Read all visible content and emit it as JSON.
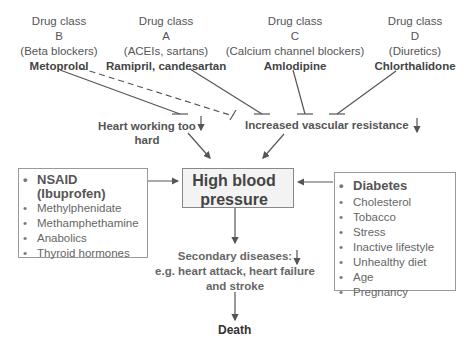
{
  "drug_classes": [
    {
      "title": "Drug class",
      "letter": "B",
      "group": "(Beta blockers)",
      "drug": "Metoprolol"
    },
    {
      "title": "Drug class",
      "letter": "A",
      "group": "(ACEIs, sartans)",
      "drug": "Ramipril, candesartan"
    },
    {
      "title": "Drug class",
      "letter": "C",
      "group": "(Calcium channel blockers)",
      "drug": "Amlodipine"
    },
    {
      "title": "Drug class",
      "letter": "D",
      "group": "(Diuretics)",
      "drug": "Chlorthalidone"
    }
  ],
  "mechanisms": {
    "heart_line1": "Heart working too",
    "heart_line2": "hard",
    "vascular": "Increased vascular resistance"
  },
  "central": {
    "line1": "High blood",
    "line2": "pressure"
  },
  "left_box": {
    "items": [
      "NSAID",
      "(Ibuprofen)",
      "Methylphenidate",
      "Methamphethamine",
      "Anabolics",
      "Thyroid hormones"
    ]
  },
  "right_box": {
    "items": [
      "Diabetes",
      "Cholesterol",
      "Tobacco",
      "Stress",
      "Inactive lifestyle",
      "Unhealthy diet",
      "Age",
      "Pregnancy"
    ]
  },
  "secondary": {
    "line1": "Secondary diseases:",
    "line2": "e.g. heart attack, heart failure",
    "line3": "and stroke"
  },
  "outcome": "Death",
  "colors": {
    "line": "#555555",
    "box_border": "#999999",
    "hbp_fill": "#f3f3f3"
  }
}
